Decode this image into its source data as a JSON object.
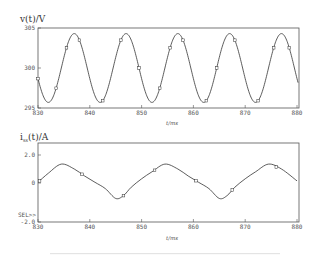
{
  "chart_data": [
    {
      "type": "line",
      "title": "",
      "ylabel": "v(t)/V",
      "xlabel": "t/ms",
      "xlim": [
        830,
        880
      ],
      "ylim": [
        295,
        305
      ],
      "x_ticks": [
        "830",
        "840",
        "850",
        "860",
        "870",
        "880"
      ],
      "y_ticks": [
        "295",
        "300",
        "305"
      ],
      "grid": false,
      "series": [
        {
          "name": "v(t)",
          "description": "sinusoidal voltage, period 10 ms, mean 300 V, amplitude ~4.3 V, peaks near 837,847,857,867,877 ms",
          "offset": 300,
          "amplitude": 4.3,
          "period_ms": 10,
          "peak_t": 837,
          "markers_x": [
            830,
            833.5,
            835.5,
            838,
            842.5,
            846,
            849.5,
            853.5,
            855.5,
            858,
            862.5,
            864.5,
            868,
            872.5,
            875.5,
            878.5
          ]
        }
      ]
    },
    {
      "type": "line",
      "title": "",
      "ylabel": "i_ss(t)/A",
      "xlabel": "t/ms",
      "xlim": [
        830,
        880
      ],
      "ylim": [
        -2.0,
        3.0
      ],
      "x_ticks": [
        "830",
        "840",
        "850",
        "860",
        "870",
        "880"
      ],
      "y_ticks": [
        "-2.0",
        "0",
        "2.0"
      ],
      "extra_label": "SEL>>",
      "grid": false,
      "series": [
        {
          "name": "i_ss(t)",
          "x": [
            830,
            832,
            834.5,
            837,
            839,
            841,
            843,
            845,
            846.5,
            848,
            850,
            852,
            854.5,
            857,
            859,
            861,
            863,
            865,
            866.5,
            868,
            870,
            872,
            874.5,
            877,
            880
          ],
          "y": [
            0.05,
            0.7,
            1.35,
            1.0,
            0.5,
            0.05,
            -0.4,
            -1.1,
            -0.9,
            -0.3,
            0.3,
            0.8,
            1.35,
            1.0,
            0.5,
            0.05,
            -0.4,
            -1.1,
            -0.9,
            -0.3,
            0.3,
            0.8,
            1.35,
            1.0,
            0.15
          ],
          "markers_x": [
            830.3,
            838.5,
            846.5,
            852.5,
            860.5,
            867.5,
            876
          ]
        }
      ]
    }
  ],
  "plots": {
    "top": {
      "ylabel": "v(t)/V",
      "xlabel": "t/ms",
      "y_ticks": [
        "305",
        "300",
        "295"
      ],
      "x_ticks": [
        "830",
        "840",
        "850",
        "860",
        "870",
        "880"
      ]
    },
    "bottom": {
      "ylabel_main": "i",
      "ylabel_sub": "ss",
      "ylabel_rest": "(t)/A",
      "xlabel": "t/ms",
      "y_ticks": [
        "2.0",
        "0",
        "-2.0"
      ],
      "sel_label": "SEL>>",
      "x_ticks": [
        "830",
        "840",
        "850",
        "860",
        "870",
        "880"
      ]
    }
  }
}
